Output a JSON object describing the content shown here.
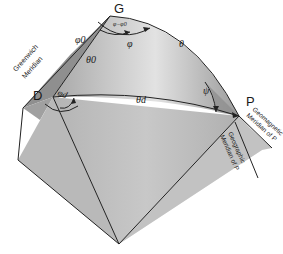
{
  "diagram": {
    "points": {
      "G": "G",
      "D": "D",
      "P": "P"
    },
    "angles": {
      "phi0": "φ0",
      "phi": "φ",
      "phi_d": "φd",
      "psi": "ψ",
      "phi_minus_phi0": "φ−φ0"
    },
    "arcs": {
      "theta0": "θ0",
      "theta": "θ",
      "theta_d": "θd"
    },
    "meridians": {
      "greenwich_line1": "Greenwich",
      "greenwich_line2": "Meridian",
      "geomagnetic_line1": "Geomagnetic",
      "geomagnetic_line2": "Meridian of P",
      "geographic_line1": "Geographic",
      "geographic_line2": "Meridian of P"
    },
    "colors": {
      "greenwich_plane": "#8f8f8f",
      "sphere_light": "#e4e4e4",
      "sphere_dark": "#9a9a9a",
      "geographic_plane": "#d6d6d6",
      "geomagnetic_plane": "#bdbdbd",
      "line": "#222222"
    }
  }
}
